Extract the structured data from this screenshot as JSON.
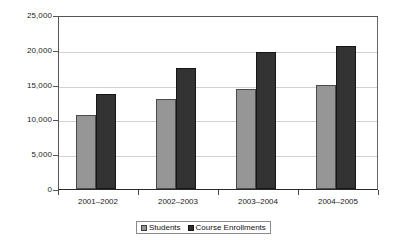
{
  "chart_data": {
    "type": "bar",
    "title": "",
    "subtitle": "",
    "xlabel": "",
    "ylabel": "",
    "categories": [
      "2001–2002",
      "2002–2003",
      "2003–2004",
      "2004–2005"
    ],
    "series": [
      {
        "name": "Students",
        "color": "#969696",
        "values": [
          10600,
          13000,
          14400,
          14900
        ]
      },
      {
        "name": "Course Enrollments",
        "color": "#333333",
        "values": [
          13700,
          17400,
          19700,
          20600
        ]
      }
    ],
    "ylim": [
      0,
      25000
    ],
    "ytick_values": [
      0,
      5000,
      10000,
      15000,
      20000,
      25000
    ],
    "ytick_labels": [
      "0",
      "5,000",
      "10,000",
      "15,000",
      "20,000",
      "25,000"
    ],
    "grid": true,
    "grid_axis": "y",
    "legend_position": "bottom-center",
    "legend_entries": [
      "Students",
      "Course Enrollments"
    ],
    "annotations": []
  },
  "legend": {
    "items": [
      {
        "label": "Students",
        "swatch": "students-swatch-icon"
      },
      {
        "label": "Course Enrollments",
        "swatch": "course-enrollments-swatch-icon"
      }
    ]
  },
  "colors": {
    "students_bar": "#969696",
    "enrollments_bar": "#333333",
    "gridline": "#d2d2d2",
    "axis": "#555555",
    "background": "#ffffff",
    "text": "#1a1a1a"
  }
}
